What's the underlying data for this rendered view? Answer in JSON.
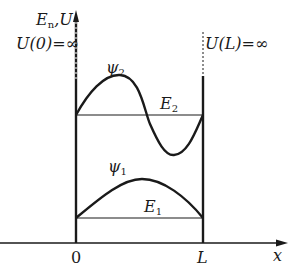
{
  "diagram": {
    "colors": {
      "ink": "#1a1a1a",
      "background": "#ffffff"
    },
    "axes": {
      "y_label": "E_n,U",
      "y_label_main": "E",
      "y_label_sub": "n",
      "y_label_rest": ",U",
      "x_label": "x",
      "origin_label": "0",
      "L_label": "L"
    },
    "walls": {
      "left_label": "U(0)=∞",
      "left_label_text": "U(0)=",
      "right_label": "U(L)=∞",
      "right_label_text": "U(L)=",
      "infinity": "∞"
    },
    "levels": [
      {
        "name": "E_1",
        "main": "E",
        "sub": "1"
      },
      {
        "name": "E_2",
        "main": "E",
        "sub": "2"
      }
    ],
    "wavefunctions": [
      {
        "name": "psi_1",
        "main": "ψ",
        "sub": "1",
        "shape": "half sine (one antinode)"
      },
      {
        "name": "psi_2",
        "main": "ψ",
        "sub": "2",
        "shape": "full sine (one node)"
      }
    ]
  }
}
